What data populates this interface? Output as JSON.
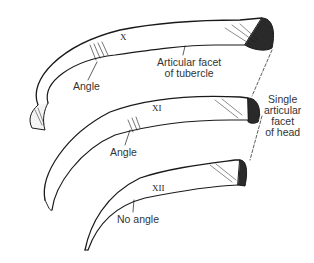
{
  "figure": {
    "ribs": [
      {
        "numeral": "X"
      },
      {
        "numeral": "XI"
      },
      {
        "numeral": "XII"
      }
    ],
    "labels": {
      "angle_x": "Angle",
      "articular_facet_tubercle": [
        "Articular facet",
        "of tubercle"
      ],
      "angle_xi": "Angle",
      "single_facet_head": [
        "Single",
        "articular",
        "facet",
        "of head"
      ],
      "no_angle": "No angle"
    },
    "colors": {
      "ink": "#1a1a1a",
      "background": "#ffffff",
      "text": "#333333"
    }
  }
}
